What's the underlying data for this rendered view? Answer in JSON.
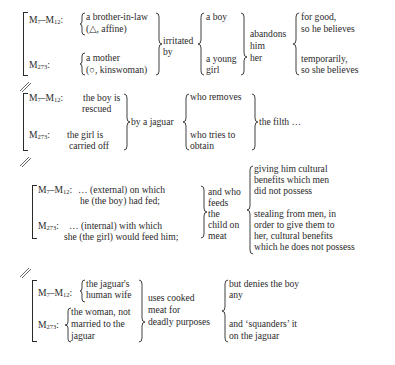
{
  "myth_labels": {
    "m7_m12": {
      "base": "M",
      "sub1": "7",
      "dash": "–M",
      "sub2": "12",
      "colon": ":"
    },
    "m273": {
      "base": "M",
      "sub": "273",
      "colon": ":"
    }
  },
  "block1": {
    "m7_m12_lines": [
      "a brother-in-law",
      "(△, affine)"
    ],
    "m273_lines": [
      "a mother",
      "(○, kinswoman)"
    ],
    "verb_lines": [
      "irritated",
      "by"
    ],
    "object_lines": [
      "a boy",
      "a young",
      "girl"
    ],
    "action_lines": [
      "abandons",
      "him",
      "her"
    ],
    "outcome_lines": [
      "for good,",
      "so he believes",
      "temporarily,",
      "so she believes"
    ]
  },
  "block2": {
    "m7_m12_lines": [
      "the boy is",
      "rescued"
    ],
    "m273_lines": [
      "the girl is",
      "carried off"
    ],
    "agent": "by a jaguar",
    "action_lines": [
      "who removes",
      "who tries to",
      "obtain"
    ],
    "object": "the filth …"
  },
  "block3": {
    "m7_m12_lines": [
      "… (external) on which",
      "he (the boy) had fed;"
    ],
    "m273_lines": [
      "… (internal) with which",
      "she (the girl) would feed him;"
    ],
    "middle_lines": [
      "and who",
      "feeds",
      "the",
      "child on",
      "meat"
    ],
    "outcome_a_lines": [
      "giving him cultural",
      "benefits which men",
      "did not possess"
    ],
    "outcome_b_lines": [
      "stealing from men, in",
      "order to give them to",
      "her, cultural benefits",
      "which he does not possess"
    ]
  },
  "block4": {
    "m7_m12_lines": [
      "the jaguar's",
      "human wife"
    ],
    "m273_lines": [
      "the woman, not",
      "married to the",
      "jaguar"
    ],
    "middle_lines": [
      "uses cooked",
      "meat for",
      "deadly purposes"
    ],
    "outcome_a_lines": [
      "but denies the boy",
      "any"
    ],
    "outcome_b_lines": [
      "and ‘squanders’ it",
      "on the jaguar"
    ]
  },
  "divider_symbol": "//"
}
